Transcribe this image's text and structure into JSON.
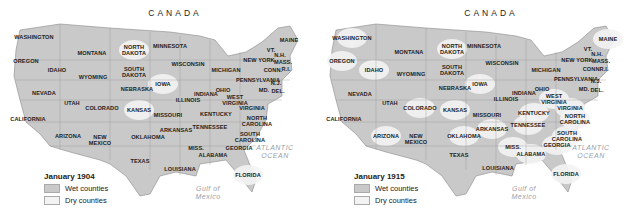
{
  "colors": {
    "wet": "#c9c9c9",
    "dry": "#f3f3f3",
    "border": "#8a8a8a",
    "water_text": "#9aa0a6"
  },
  "labels": {
    "canada": "CANADA",
    "atlantic": "ATLANTIC OCEAN",
    "gulf": "Gulf of Mexico"
  },
  "maps": [
    {
      "legend": {
        "title": "January 1904",
        "wet": "Wet counties",
        "dry": "Dry counties"
      },
      "states": [
        {
          "name": "WASHINGTON",
          "x": 34,
          "y": 37,
          "wet": true
        },
        {
          "name": "OREGON",
          "x": 26,
          "y": 61,
          "wet": true
        },
        {
          "name": "IDAHO",
          "x": 57,
          "y": 70,
          "wet": true
        },
        {
          "name": "MONTANA",
          "x": 92,
          "y": 53,
          "wet": true
        },
        {
          "name": "WYOMING",
          "x": 93,
          "y": 77,
          "wet": true
        },
        {
          "name": "NEVADA",
          "x": 44,
          "y": 93,
          "wet": true
        },
        {
          "name": "UTAH",
          "x": 72,
          "y": 103,
          "wet": true
        },
        {
          "name": "COLORADO",
          "x": 102,
          "y": 108,
          "wet": true
        },
        {
          "name": "CALIFORNIA",
          "x": 28,
          "y": 119,
          "wet": true
        },
        {
          "name": "ARIZONA",
          "x": 68,
          "y": 136,
          "wet": true
        },
        {
          "name": "NEW MEXICO",
          "x": 100,
          "y": 140,
          "wet": true
        },
        {
          "name": "NORTH DAKOTA",
          "x": 134,
          "y": 50,
          "wet": false
        },
        {
          "name": "SOUTH DAKOTA",
          "x": 134,
          "y": 72,
          "wet": true
        },
        {
          "name": "NEBRASKA",
          "x": 137,
          "y": 89,
          "wet": true
        },
        {
          "name": "KANSAS",
          "x": 139,
          "y": 110,
          "wet": false
        },
        {
          "name": "OKLAHOMA",
          "x": 148,
          "y": 137,
          "wet": true
        },
        {
          "name": "TEXAS",
          "x": 140,
          "y": 161,
          "wet": true
        },
        {
          "name": "MINNESOTA",
          "x": 170,
          "y": 46,
          "wet": true
        },
        {
          "name": "IOWA",
          "x": 163,
          "y": 84,
          "wet": false
        },
        {
          "name": "MISSOURI",
          "x": 168,
          "y": 115,
          "wet": true
        },
        {
          "name": "ARKANSAS",
          "x": 176,
          "y": 130,
          "wet": true
        },
        {
          "name": "LOUISIANA",
          "x": 180,
          "y": 169,
          "wet": true
        },
        {
          "name": "WISCONSIN",
          "x": 188,
          "y": 64,
          "wet": true
        },
        {
          "name": "ILLINOIS",
          "x": 188,
          "y": 100,
          "wet": true
        },
        {
          "name": "MICHIGAN",
          "x": 226,
          "y": 70,
          "wet": true
        },
        {
          "name": "INDIANA",
          "x": 206,
          "y": 94,
          "wet": true
        },
        {
          "name": "OHIO",
          "x": 223,
          "y": 90,
          "wet": true
        },
        {
          "name": "KENTUCKY",
          "x": 216,
          "y": 114,
          "wet": true
        },
        {
          "name": "TENNESSEE",
          "x": 210,
          "y": 127,
          "wet": true
        },
        {
          "name": "MISS.",
          "x": 196,
          "y": 148,
          "wet": true
        },
        {
          "name": "ALABAMA",
          "x": 213,
          "y": 155,
          "wet": true
        },
        {
          "name": "GEORGIA",
          "x": 239,
          "y": 148,
          "wet": true
        },
        {
          "name": "FLORIDA",
          "x": 248,
          "y": 175,
          "wet": false
        },
        {
          "name": "WEST VIRGINIA",
          "x": 235,
          "y": 100,
          "wet": true
        },
        {
          "name": "VIRGINIA",
          "x": 252,
          "y": 108,
          "wet": true
        },
        {
          "name": "NORTH CAROLINA",
          "x": 257,
          "y": 121,
          "wet": true
        },
        {
          "name": "SOUTH CAROLINA",
          "x": 250,
          "y": 137,
          "wet": true
        },
        {
          "name": "PENNSYLVANIA",
          "x": 258,
          "y": 80,
          "wet": true
        },
        {
          "name": "NEW YORK",
          "x": 259,
          "y": 60,
          "wet": true
        },
        {
          "name": "MAINE",
          "x": 289,
          "y": 40,
          "wet": true
        },
        {
          "name": "VT.",
          "x": 271,
          "y": 50,
          "wet": true
        },
        {
          "name": "N.H.",
          "x": 280,
          "y": 55,
          "wet": true
        },
        {
          "name": "MASS.",
          "x": 283,
          "y": 62,
          "wet": true
        },
        {
          "name": "CONN.",
          "x": 273,
          "y": 70,
          "wet": true
        },
        {
          "name": "R.I.",
          "x": 286,
          "y": 69,
          "wet": true
        },
        {
          "name": "N.J.",
          "x": 276,
          "y": 83,
          "wet": true
        },
        {
          "name": "MD.",
          "x": 264,
          "y": 90,
          "wet": true
        },
        {
          "name": "DEL.",
          "x": 278,
          "y": 91,
          "wet": true
        }
      ]
    },
    {
      "legend": {
        "title": "January 1915",
        "wet": "Wet counties",
        "dry": "Dry counties"
      },
      "states": [
        {
          "name": "WASHINGTON",
          "x": 36,
          "y": 38,
          "wet": false
        },
        {
          "name": "OREGON",
          "x": 26,
          "y": 61,
          "wet": false
        },
        {
          "name": "IDAHO",
          "x": 58,
          "y": 70,
          "wet": false
        },
        {
          "name": "MONTANA",
          "x": 93,
          "y": 52,
          "wet": true
        },
        {
          "name": "WYOMING",
          "x": 95,
          "y": 74,
          "wet": true
        },
        {
          "name": "NEVADA",
          "x": 44,
          "y": 94,
          "wet": true
        },
        {
          "name": "UTAH",
          "x": 74,
          "y": 103,
          "wet": true
        },
        {
          "name": "COLORADO",
          "x": 104,
          "y": 108,
          "wet": false
        },
        {
          "name": "CALIFORNIA",
          "x": 28,
          "y": 119,
          "wet": true
        },
        {
          "name": "ARIZONA",
          "x": 70,
          "y": 136,
          "wet": false
        },
        {
          "name": "NEW MEXICO",
          "x": 100,
          "y": 139,
          "wet": true
        },
        {
          "name": "NORTH DAKOTA",
          "x": 136,
          "y": 49,
          "wet": false
        },
        {
          "name": "SOUTH DAKOTA",
          "x": 136,
          "y": 70,
          "wet": true
        },
        {
          "name": "NEBRASKA",
          "x": 139,
          "y": 88,
          "wet": true
        },
        {
          "name": "KANSAS",
          "x": 139,
          "y": 110,
          "wet": false
        },
        {
          "name": "OKLAHOMA",
          "x": 148,
          "y": 136,
          "wet": false
        },
        {
          "name": "TEXAS",
          "x": 143,
          "y": 155,
          "wet": true
        },
        {
          "name": "MINNESOTA",
          "x": 168,
          "y": 46,
          "wet": true
        },
        {
          "name": "IOWA",
          "x": 164,
          "y": 84,
          "wet": false
        },
        {
          "name": "MISSOURI",
          "x": 171,
          "y": 115,
          "wet": true
        },
        {
          "name": "ARKANSAS",
          "x": 176,
          "y": 129,
          "wet": false
        },
        {
          "name": "LOUISIANA",
          "x": 182,
          "y": 168,
          "wet": true
        },
        {
          "name": "WISCONSIN",
          "x": 186,
          "y": 63,
          "wet": true
        },
        {
          "name": "ILLINOIS",
          "x": 190,
          "y": 99,
          "wet": true
        },
        {
          "name": "MICHIGAN",
          "x": 230,
          "y": 70,
          "wet": true
        },
        {
          "name": "INDIANA",
          "x": 208,
          "y": 93,
          "wet": true
        },
        {
          "name": "OHIO",
          "x": 226,
          "y": 89,
          "wet": true
        },
        {
          "name": "KENTUCKY",
          "x": 218,
          "y": 113,
          "wet": false
        },
        {
          "name": "TENNESSEE",
          "x": 212,
          "y": 125,
          "wet": false
        },
        {
          "name": "MISS.",
          "x": 197,
          "y": 147,
          "wet": false
        },
        {
          "name": "ALABAMA",
          "x": 215,
          "y": 154,
          "wet": false
        },
        {
          "name": "GEORGIA",
          "x": 241,
          "y": 145,
          "wet": false
        },
        {
          "name": "FLORIDA",
          "x": 250,
          "y": 174,
          "wet": false
        },
        {
          "name": "WEST VIRGINIA",
          "x": 238,
          "y": 99,
          "wet": false
        },
        {
          "name": "VIRGINIA",
          "x": 254,
          "y": 108,
          "wet": false
        },
        {
          "name": "NORTH CAROLINA",
          "x": 259,
          "y": 119,
          "wet": false
        },
        {
          "name": "SOUTH CAROLINA",
          "x": 251,
          "y": 136,
          "wet": false
        },
        {
          "name": "PENNSYLVANIA",
          "x": 260,
          "y": 79,
          "wet": true
        },
        {
          "name": "NEW YORK",
          "x": 261,
          "y": 60,
          "wet": true
        },
        {
          "name": "MAINE",
          "x": 292,
          "y": 39,
          "wet": false
        },
        {
          "name": "VT.",
          "x": 272,
          "y": 49,
          "wet": true
        },
        {
          "name": "N.H.",
          "x": 281,
          "y": 54,
          "wet": true
        },
        {
          "name": "MASS.",
          "x": 285,
          "y": 61,
          "wet": true
        },
        {
          "name": "CONN.",
          "x": 276,
          "y": 69,
          "wet": true
        },
        {
          "name": "R.I.",
          "x": 288,
          "y": 69,
          "wet": true
        },
        {
          "name": "N.J.",
          "x": 280,
          "y": 81,
          "wet": true
        },
        {
          "name": "MD.",
          "x": 268,
          "y": 89,
          "wet": true
        },
        {
          "name": "DEL.",
          "x": 281,
          "y": 90,
          "wet": true
        }
      ]
    }
  ]
}
